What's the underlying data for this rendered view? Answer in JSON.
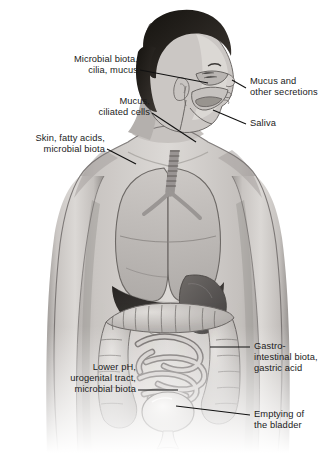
{
  "figure": {
    "view": "anterior torso cutaway with head in three-quarter profile",
    "palette": {
      "background": "#ffffff",
      "skin_light": "#d7d4d2",
      "skin_mid": "#b9b5b3",
      "skin_shadow": "#8e8a88",
      "hair_dark": "#221f1e",
      "organ_light": "#cfcbc8",
      "organ_mid": "#a6a2a0",
      "liver_dark": "#3b3836",
      "outline": "#4a4746",
      "label_text": "#1b1b1b",
      "leader_line": "#111111"
    },
    "labels": [
      {
        "id": "nasal",
        "lines": [
          "Microbial biota,",
          "cilia, mucus"
        ],
        "align": "right",
        "x": 138,
        "y": 54,
        "leader": {
          "x1": 140,
          "y1": 70,
          "x2": 208,
          "y2": 83
        }
      },
      {
        "id": "trachea",
        "lines": [
          "Mucus,",
          "ciliated cells"
        ],
        "align": "right",
        "x": 150,
        "y": 96,
        "leader": {
          "x1": 152,
          "y1": 113,
          "x2": 196,
          "y2": 140
        }
      },
      {
        "id": "skin",
        "lines": [
          "Skin, fatty acids,",
          "microbial biota"
        ],
        "align": "right",
        "x": 105,
        "y": 133,
        "leader": {
          "x1": 107,
          "y1": 149,
          "x2": 134,
          "y2": 163
        }
      },
      {
        "id": "mucus-secretions",
        "lines": [
          "Mucus and",
          "other secretions"
        ],
        "align": "left",
        "x": 248,
        "y": 82,
        "leader": {
          "x1": 246,
          "y1": 88,
          "x2": 233,
          "y2": 81
        }
      },
      {
        "id": "saliva",
        "lines": [
          "Saliva"
        ],
        "align": "left",
        "x": 248,
        "y": 121,
        "leader": {
          "x1": 246,
          "y1": 124,
          "x2": 214,
          "y2": 112
        }
      },
      {
        "id": "gi",
        "lines": [
          "Gastro-",
          "intestinal biota,",
          "gastric acid"
        ],
        "align": "left",
        "x": 252,
        "y": 341,
        "leader": {
          "x1": 250,
          "y1": 347,
          "x2": 212,
          "y2": 347
        }
      },
      {
        "id": "bladder",
        "lines": [
          "Emptying of",
          "the bladder"
        ],
        "align": "left",
        "x": 252,
        "y": 409,
        "leader": {
          "x1": 250,
          "y1": 415,
          "x2": 178,
          "y2": 406
        }
      },
      {
        "id": "urogenital",
        "lines": [
          "Lower pH,",
          "urogenital tract,",
          "microbial biota"
        ],
        "align": "right",
        "x": 136,
        "y": 362,
        "leader": {
          "x1": 138,
          "y1": 390,
          "x2": 176,
          "y2": 390
        }
      }
    ]
  }
}
